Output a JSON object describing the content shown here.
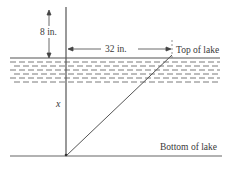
{
  "diagram": {
    "labels": {
      "height_above": "8 in.",
      "horizontal_distance": "32 in.",
      "top_of_lake": "Top of lake",
      "bottom_of_lake": "Bottom of lake",
      "depth_variable": "x"
    },
    "colors": {
      "line": "#555555",
      "water_dash": "#7a7a7a",
      "text": "#3a3a3a",
      "background": "#ffffff"
    }
  }
}
